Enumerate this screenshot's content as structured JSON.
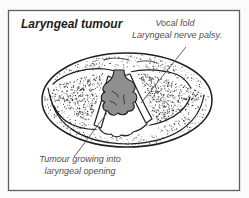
{
  "figure": {
    "title": "Laryngeal tumour",
    "annotations": {
      "vocal_fold": {
        "line1": "Vocal fold",
        "line2": "Laryngeal nerve palsy."
      },
      "tumour": {
        "line1": "Tumour growing into",
        "line2": "laryngeal opening"
      }
    },
    "colors": {
      "background": "#ffffff",
      "border": "#5f5f5f",
      "outline": "#1f1f1f",
      "stipple": "#3d3d3d",
      "tumour_fill": "#8f8f8f",
      "title_text": "#1c1c1c",
      "label_text": "#4f4f4f",
      "leader_line": "#4f4f4f"
    }
  }
}
